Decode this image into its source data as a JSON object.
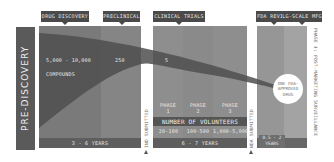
{
  "pre_discovery": {
    "label": "PRE-DISCOVERY"
  },
  "stages": [
    {
      "id": "drug-discovery",
      "label": "DRUG DISCOVERY"
    },
    {
      "id": "preclinical",
      "label": "PRECLINICAL"
    },
    {
      "id": "clinical-trials",
      "label": "CLINICAL TRIALS"
    },
    {
      "id": "fda-review",
      "label": "FDA REVIEW"
    },
    {
      "id": "lg-scale-mfg",
      "label": "LG-SCALE MFG"
    }
  ],
  "counts": {
    "discovery": "5,000 - 10,000",
    "discovery_unit": "COMPOUNDS",
    "preclinical": "250",
    "clinical": "5"
  },
  "milestones": {
    "ind": "IND SUBMITTED",
    "nda": "NDA SUBMITTED",
    "phase4": "PHASE 4: POST-MARKETING SURVEILLANCE"
  },
  "phases": [
    {
      "label": "PHASE",
      "num": "1",
      "volunteers": "20-100"
    },
    {
      "label": "PHASE",
      "num": "2",
      "volunteers": "100-500"
    },
    {
      "label": "PHASE",
      "num": "3",
      "volunteers": "1,000-5,000"
    }
  ],
  "volunteers_header": "NUMBER OF VOLUNTEERS",
  "durations": {
    "discovery": "3 - 6 YEARS",
    "clinical": "6 - 7 YEARS",
    "review_line1": "0.5 - 2",
    "review_line2": "YEARS"
  },
  "outcome": {
    "line1": "ONE FDA-",
    "line2": "APPROVED",
    "line3": "DRUG"
  },
  "colors": {
    "band_dark": "#5a5a5a",
    "tag_bg": "#4a4a4a",
    "funnel": "#555555",
    "circle": "#ffffff"
  }
}
